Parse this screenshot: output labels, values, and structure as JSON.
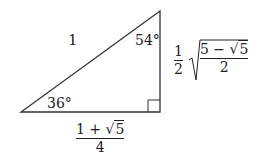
{
  "diagram": {
    "type": "right-triangle",
    "vertices": {
      "bottom_left": [
        21,
        112
      ],
      "bottom_right_right_angle": [
        160,
        112
      ],
      "top": [
        160,
        11
      ]
    },
    "line_color": "#333333",
    "hypotenuse_label": "1",
    "angle_top": "54°",
    "angle_bottom_left": "36°",
    "bottom_side": {
      "numerator_a": "1 + ",
      "numerator_sqrt": "5",
      "denominator": "4",
      "radical": "√"
    },
    "right_side": {
      "coef_num": "1",
      "coef_den": "2",
      "radical": "√",
      "inner_num_a": "5 − ",
      "inner_num_sqrt": "5",
      "inner_den": "2"
    }
  }
}
